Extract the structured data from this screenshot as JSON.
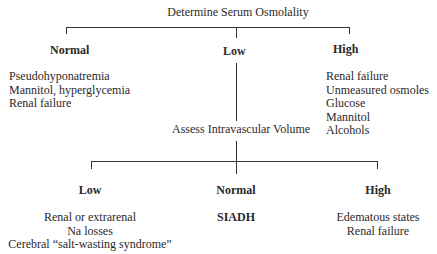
{
  "root": "Determine Serum Osmolality",
  "level1": {
    "normal": {
      "label": "Normal",
      "items": [
        "Pseudohyponatremia",
        "Mannitol, hyperglycemia",
        "Renal failure"
      ]
    },
    "low": {
      "label": "Low"
    },
    "high": {
      "label": "High",
      "items": [
        "Renal failure",
        "Unmeasured osmoles",
        "Glucose",
        "Mannitol",
        "Alcohols"
      ]
    }
  },
  "assess": "Assess Intravascular Volume",
  "level2": {
    "low": {
      "label": "Low",
      "items": [
        "Renal or extrarenal",
        "Na losses",
        "Cerebral “salt-wasting syndrome”"
      ]
    },
    "normal": {
      "label": "Normal",
      "items": [
        "SIADH"
      ]
    },
    "high": {
      "label": "High",
      "items": [
        "Edematous states",
        "Renal failure"
      ]
    }
  }
}
